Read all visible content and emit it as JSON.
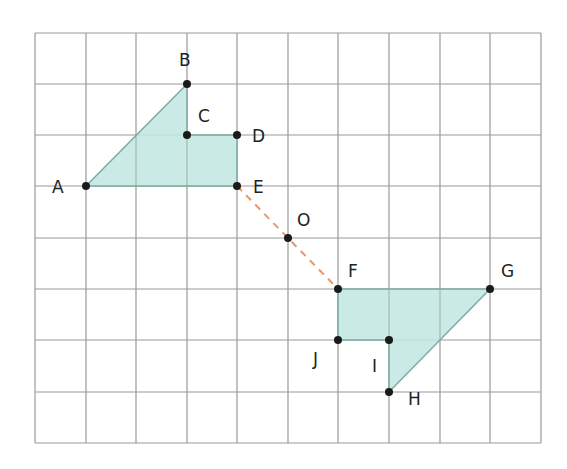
{
  "grid": {
    "cols": 10,
    "rows": 8,
    "x_lines": [
      35,
      86,
      136,
      187,
      237,
      288,
      338,
      389,
      440,
      490,
      541
    ],
    "y_lines": [
      33,
      84,
      135,
      186,
      238,
      289,
      340,
      392,
      443
    ],
    "line_color": "#9a9a9a"
  },
  "colors": {
    "fill": "#bfe6e1",
    "edge": "#7fa9a4",
    "point": "#1a1a1a",
    "dashed": "#e8976a"
  },
  "shapes": [
    {
      "name": "ABCDE",
      "vertices": [
        "A",
        "B",
        "C",
        "D",
        "E"
      ]
    },
    {
      "name": "FGHIJ",
      "vertices": [
        "F",
        "G",
        "H",
        "I",
        "J"
      ]
    }
  ],
  "points": {
    "A": {
      "label": "A",
      "x": 86,
      "y": 186
    },
    "B": {
      "label": "B",
      "x": 187,
      "y": 84
    },
    "C": {
      "label": "C",
      "x": 187,
      "y": 135
    },
    "D": {
      "label": "D",
      "x": 237,
      "y": 135
    },
    "E": {
      "label": "E",
      "x": 237,
      "y": 186
    },
    "O": {
      "label": "O",
      "x": 288,
      "y": 238
    },
    "F": {
      "label": "F",
      "x": 338,
      "y": 289
    },
    "G": {
      "label": "G",
      "x": 490,
      "y": 289
    },
    "H": {
      "label": "H",
      "x": 389,
      "y": 392
    },
    "I": {
      "label": "I",
      "x": 389,
      "y": 340
    },
    "J": {
      "label": "J",
      "x": 338,
      "y": 340
    }
  },
  "labels": {
    "A": "A",
    "B": "B",
    "C": "C",
    "D": "D",
    "E": "E",
    "O": "O",
    "F": "F",
    "G": "G",
    "H": "H",
    "I": "I",
    "J": "J"
  },
  "dashed_segment": {
    "from": "E",
    "to": "F",
    "through": "O"
  }
}
